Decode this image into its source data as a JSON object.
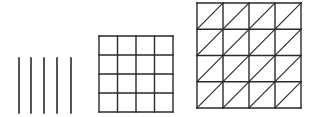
{
  "diagram": {
    "background": "#ffffff",
    "stroke_color": "#2a2a2a",
    "figures": [
      {
        "name": "parallel-lines",
        "type": "lines",
        "count": 5,
        "x_positions": [
          19,
          31,
          44,
          57,
          71
        ],
        "y_top": 58,
        "y_bottom": 113
      },
      {
        "name": "square-grid",
        "type": "grid",
        "rows": 4,
        "cols": 4,
        "x": 99,
        "y": 36,
        "width": 74,
        "height": 76
      },
      {
        "name": "triangulated-grid",
        "type": "triangulated-grid",
        "rows": 4,
        "cols": 4,
        "diagonal": "bottom-left-to-top-right",
        "x": 197,
        "y": 3,
        "width": 104,
        "height": 105
      }
    ]
  }
}
